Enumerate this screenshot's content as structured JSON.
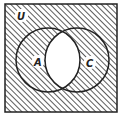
{
  "diagram": {
    "type": "venn",
    "universe_label": "U",
    "sets": [
      {
        "label": "A"
      },
      {
        "label": "C"
      }
    ],
    "shaded_region": "complement of A ∩ C",
    "unshaded_region": "A ∩ C",
    "colors": {
      "line": "#222222",
      "hatch": "#333333",
      "background": "#ffffff"
    }
  }
}
